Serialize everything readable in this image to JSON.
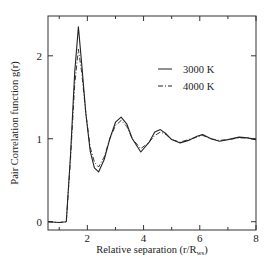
{
  "chart_data": {
    "type": "line",
    "title": "",
    "xlabel": "Relative separation  (r/R",
    "xlabel_sub": "ws",
    "xlabel_end": ")",
    "ylabel": "Pair Correlation function g(r)",
    "xlim": [
      0.6,
      8
    ],
    "ylim": [
      -0.1,
      2.48
    ],
    "xticks": [
      "2",
      "4",
      "6",
      "8"
    ],
    "yticks": [
      "0",
      "1",
      "2"
    ],
    "grid": false,
    "legend_position": "upper right",
    "series": [
      {
        "name": "3000 K",
        "style": "solid",
        "x": [
          0.6,
          1.0,
          1.25,
          1.4,
          1.55,
          1.68,
          1.8,
          1.95,
          2.1,
          2.25,
          2.4,
          2.6,
          2.8,
          3.0,
          3.2,
          3.4,
          3.6,
          3.9,
          4.2,
          4.4,
          4.6,
          4.8,
          5.0,
          5.3,
          5.6,
          5.9,
          6.1,
          6.4,
          6.7,
          7.0,
          7.4,
          7.7,
          8.0
        ],
        "y": [
          0.0,
          -0.01,
          0.0,
          0.8,
          1.8,
          2.35,
          1.9,
          1.3,
          0.85,
          0.65,
          0.6,
          0.75,
          1.0,
          1.2,
          1.26,
          1.18,
          1.0,
          0.84,
          0.96,
          1.08,
          1.11,
          1.06,
          0.99,
          0.95,
          0.98,
          1.03,
          1.05,
          1.0,
          0.97,
          0.99,
          1.02,
          1.01,
          0.99
        ]
      },
      {
        "name": "4000 K",
        "style": "dash-dot",
        "x": [
          0.6,
          1.0,
          1.25,
          1.4,
          1.55,
          1.68,
          1.8,
          1.95,
          2.1,
          2.25,
          2.4,
          2.6,
          2.8,
          3.0,
          3.2,
          3.4,
          3.6,
          3.9,
          4.2,
          4.4,
          4.6,
          4.8,
          5.0,
          5.3,
          5.6,
          5.9,
          6.1,
          6.4,
          6.7,
          7.0,
          7.4,
          7.7,
          8.0
        ],
        "y": [
          0.0,
          -0.01,
          0.0,
          0.75,
          1.65,
          2.08,
          1.8,
          1.3,
          0.9,
          0.72,
          0.66,
          0.78,
          1.0,
          1.16,
          1.22,
          1.15,
          1.0,
          0.88,
          0.96,
          1.04,
          1.08,
          1.05,
          0.99,
          0.96,
          0.99,
          1.02,
          1.04,
          1.0,
          0.98,
          0.99,
          1.01,
          1.01,
          0.99
        ]
      }
    ]
  }
}
